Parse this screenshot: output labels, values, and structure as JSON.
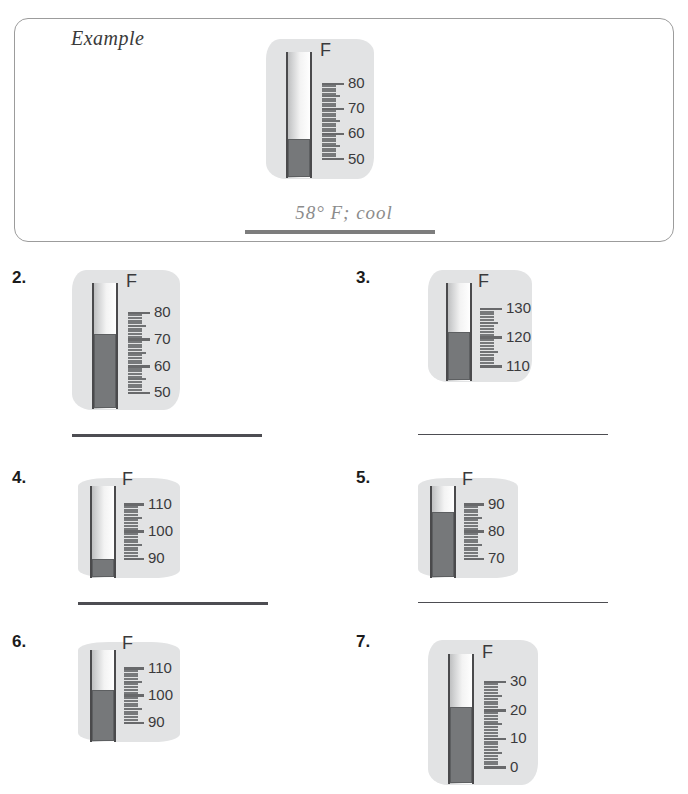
{
  "example": {
    "label": "Example",
    "answer": "58° F; cool",
    "thermometer": {
      "unit": "F",
      "tick_labels": [
        "80",
        "70",
        "60",
        "50"
      ],
      "scale_top": 85,
      "scale_bottom": 48,
      "reading": 58,
      "reading_text": "58"
    }
  },
  "problems": [
    {
      "number": "2.",
      "thermometer": {
        "unit": "F",
        "tick_labels": [
          "80",
          "70",
          "60",
          "50"
        ],
        "scale_top": 84,
        "scale_bottom": 48,
        "reading": 72,
        "blob_style": "blob"
      }
    },
    {
      "number": "3.",
      "thermometer": {
        "unit": "F",
        "tick_labels": [
          "130",
          "120",
          "110"
        ],
        "scale_top": 133,
        "scale_bottom": 108,
        "reading": 122,
        "blob_style": "blob"
      }
    },
    {
      "number": "4.",
      "thermometer": {
        "unit": "F",
        "tick_labels": [
          "110",
          "100",
          "90"
        ],
        "scale_top": 113,
        "scale_bottom": 88,
        "reading": 90,
        "blob_style": "rounded"
      }
    },
    {
      "number": "5.",
      "thermometer": {
        "unit": "F",
        "tick_labels": [
          "90",
          "80",
          "70"
        ],
        "scale_top": 93,
        "scale_bottom": 68,
        "reading": 87,
        "blob_style": "rounded"
      }
    },
    {
      "number": "6.",
      "thermometer": {
        "unit": "F",
        "tick_labels": [
          "110",
          "100",
          "90"
        ],
        "scale_top": 113,
        "scale_bottom": 88,
        "reading": 102,
        "blob_style": "rounded"
      }
    },
    {
      "number": "7.",
      "thermometer": {
        "unit": "F",
        "tick_labels": [
          "30",
          "20",
          "10",
          "0"
        ],
        "scale_top": 33,
        "scale_bottom": -2,
        "reading": 21,
        "blob_style": "blob"
      }
    }
  ],
  "colors": {
    "mercury": "#76787a",
    "blob": "#e2e3e4",
    "tube_outline": "#4a4a4c",
    "tick": "#77797b",
    "label_text": "#3a3a3c",
    "answer_line": "#4d4d52",
    "example_border": "#9c9c9c",
    "example_answer_text": "#8c8c8c"
  }
}
